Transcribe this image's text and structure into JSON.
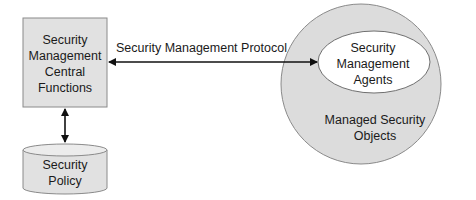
{
  "diagram": {
    "central_box": {
      "lines": [
        "Security",
        "Management",
        "Central",
        "Functions"
      ],
      "fill": "#e1e1e1"
    },
    "protocol_arrow": {
      "label": "Security Management Protocol"
    },
    "policy_store": {
      "lines": [
        "Security",
        "Policy"
      ],
      "fill": "#e1e1e1"
    },
    "managed_objects": {
      "lines": [
        "Managed Security",
        "Objects"
      ],
      "fill": "#dcdcdc"
    },
    "agents": {
      "lines": [
        "Security",
        "Management",
        "Agents"
      ],
      "fill": "#ffffff"
    }
  }
}
